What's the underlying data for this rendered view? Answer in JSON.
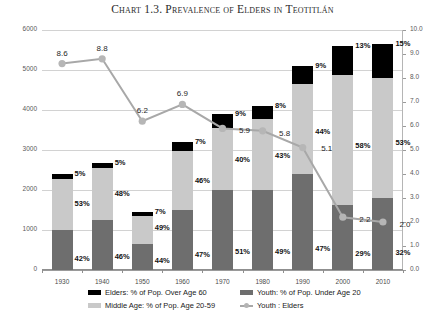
{
  "title": "Chart 1.3. Prevalence of Elders in Teotitlán",
  "chart_data": {
    "type": "bar",
    "title": "Chart 1.3. Prevalence of Elders in Teotitlán",
    "subtitle": "",
    "xlabel": "",
    "ylabel": "",
    "y2label": "",
    "grid": true,
    "legend_position": "bottom",
    "stacked": true,
    "categories": [
      "1930",
      "1940",
      "1950",
      "1960",
      "1970",
      "1980",
      "1990",
      "2000",
      "2010"
    ],
    "ylim": [
      0,
      6000
    ],
    "yticks": [
      "0",
      "1000",
      "2000",
      "3000",
      "4000",
      "5000",
      "6000"
    ],
    "y2lim": [
      0.0,
      10.0
    ],
    "y2ticks": [
      "0.0",
      "1.0",
      "2.0",
      "3.0",
      "4.0",
      "5.0",
      "6.0",
      "7.0",
      "8.0",
      "9.0",
      "10.0"
    ],
    "series": [
      {
        "name": "Youth: % of Pop. Under Age 20",
        "key": "youth",
        "color": "#6e6e6e",
        "axis": "left",
        "percent_labels": [
          "42%",
          "46%",
          "44%",
          "47%",
          "51%",
          "49%",
          "47%",
          "29%",
          "32%"
        ],
        "values": [
          1010,
          1245,
          640,
          1505,
          1990,
          2010,
          2400,
          1625,
          1810
        ]
      },
      {
        "name": "Middle Age: % of Pop. Age 20-59",
        "key": "middle",
        "color": "#c9c9c9",
        "axis": "left",
        "percent_labels": [
          "53%",
          "48%",
          "49%",
          "46%",
          "40%",
          "43%",
          "44%",
          "58%",
          "53%"
        ],
        "values": [
          1270,
          1300,
          710,
          1470,
          1560,
          1765,
          2245,
          3250,
          2995
        ]
      },
      {
        "name": "Elders: % of Pop. Over Age 60",
        "key": "elders",
        "color": "#000000",
        "axis": "left",
        "percent_labels": [
          "5%",
          "5%",
          "7%",
          "7%",
          "9%",
          "8%",
          "9%",
          "13%",
          "15%"
        ],
        "values": [
          120,
          135,
          100,
          225,
          350,
          325,
          455,
          725,
          845
        ]
      },
      {
        "name": "Youth : Elders",
        "key": "ratio",
        "color": "#a8a8a8",
        "type": "line",
        "axis": "right",
        "values": [
          8.6,
          8.8,
          6.2,
          6.9,
          5.9,
          5.8,
          5.1,
          2.2,
          2.0
        ],
        "labels": [
          "8.6",
          "8.8",
          "6.2",
          "6.9",
          "5.9",
          "5.8",
          "5.1",
          "2.2",
          "2.0"
        ]
      }
    ],
    "totals": [
      2400,
      2680,
      1450,
      3200,
      3900,
      4100,
      5100,
      5600,
      5650
    ]
  },
  "legend": [
    {
      "label": "Elders: % of Pop. Over Age 60",
      "swatch": "swatch-elder"
    },
    {
      "label": "Youth: % of Pop. Under Age 20",
      "swatch": "swatch-youth"
    },
    {
      "label": "Middle Age: % of Pop. Age 20-59",
      "swatch": "swatch-middle"
    },
    {
      "label": "Youth : Elders",
      "swatch": "swatch-line"
    }
  ]
}
